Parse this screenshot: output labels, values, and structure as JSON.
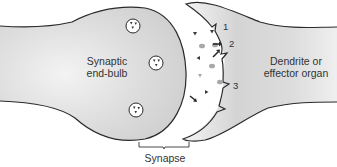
{
  "diagram": {
    "labels": {
      "end_bulb": [
        "Synaptic",
        "end-bulb"
      ],
      "dendrite": [
        "Dendrite or",
        "effector organ"
      ],
      "synapse": "Synapse",
      "marker_1": "1",
      "marker_2": "2",
      "marker_3": "3"
    },
    "vesicles": [
      {
        "cx": 133,
        "cy": 26
      },
      {
        "cx": 156,
        "cy": 63
      },
      {
        "cx": 136,
        "cy": 110
      }
    ],
    "colors": {
      "cell_fill": "#d9d9d9",
      "cell_highlight": "#f2f2f2",
      "outline": "#2a2a2a",
      "vesicle_fill": "#ffffff",
      "neurotransmitter_dark": "#3a3a3a",
      "neurotransmitter_gray": "#a8a8a8",
      "text": "#333333"
    }
  }
}
